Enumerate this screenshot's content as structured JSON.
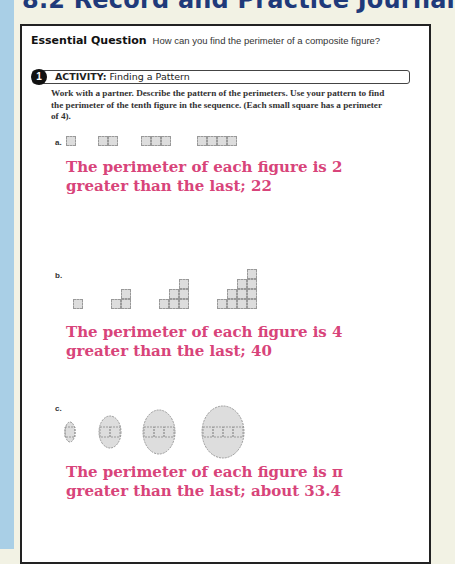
{
  "header": {
    "title": "8.2 Record and Practice Journal"
  },
  "essential_question": {
    "label": "Essential Question",
    "text": "How can you find the perimeter of a composite figure?"
  },
  "activity": {
    "number": "1",
    "label": "ACTIVITY:",
    "title": "Finding a Pattern",
    "instructions": "Work with a partner. Describe the pattern of the perimeters. Use your pattern to find the perimeter of the tenth figure in the sequence. (Each small square has a perimeter of 4)."
  },
  "parts": [
    {
      "label": "a.",
      "figure_description": "rows of 1, 2, 3, 4 small squares",
      "answer_line1": "The perimeter of each figure is 2",
      "answer_line2": "greater than the last; 22"
    },
    {
      "label": "b.",
      "figure_description": "staircases of 1, 3, 6, 10 small squares",
      "answer_line1": "The perimeter of each figure is 4",
      "answer_line2": "greater than the last; 40"
    },
    {
      "label": "c.",
      "figure_description": "rows of 1-4 squares with semicircles on top and bottom",
      "answer_line1": "The perimeter of each figure is π",
      "answer_line2": "greater than the last; about 33.4"
    }
  ],
  "colors": {
    "answer": "#d8447a",
    "heading": "#1f3a7a",
    "background": "#f2f2e4",
    "strip": "#a9cfe6"
  }
}
